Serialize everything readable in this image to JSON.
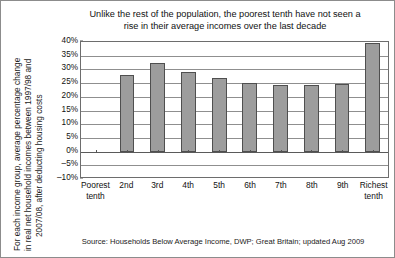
{
  "chart_data": {
    "type": "bar",
    "title": "Unlike the rest of the population, the poorest tenth have not seen a rise in their average incomes over the last decade",
    "title_line1": "Unlike the rest of the population, the poorest tenth have not seen a",
    "title_line2": "rise in their average incomes over the last decade",
    "xlabel": "",
    "ylabel": "For each income group, average percentage change in real net household incomes between 1997/98 and 2007/08, after deducting housing costs",
    "ylabel_line1": "For each income group, average percentage change",
    "ylabel_line2": "in real net household incomes between 1997/98 and",
    "ylabel_line3": "2007/08, after deducting housing costs",
    "categories": [
      "Poorest tenth",
      "2nd",
      "3rd",
      "4th",
      "5th",
      "6th",
      "7th",
      "8th",
      "9th",
      "Richest tenth"
    ],
    "category_lines": [
      [
        "Poorest",
        "tenth"
      ],
      [
        "2nd",
        ""
      ],
      [
        "3rd",
        ""
      ],
      [
        "4th",
        ""
      ],
      [
        "5th",
        ""
      ],
      [
        "6th",
        ""
      ],
      [
        "7th",
        ""
      ],
      [
        "8th",
        ""
      ],
      [
        "9th",
        ""
      ],
      [
        "Richest",
        "tenth"
      ]
    ],
    "values": [
      0,
      28.0,
      32.2,
      29.0,
      26.7,
      25.2,
      24.2,
      24.2,
      24.7,
      39.5
    ],
    "ylim": [
      -10,
      40
    ],
    "ytick_values": [
      40,
      35,
      30,
      25,
      20,
      15,
      10,
      5,
      0,
      -5,
      -10
    ],
    "ytick_labels": [
      "40%",
      "35%",
      "30%",
      "25%",
      "20%",
      "15%",
      "10%",
      "5%",
      "0%",
      "–5%",
      "–10%"
    ],
    "grid": true,
    "legend": null,
    "bar_color": "#9d9d9d",
    "bar_edge_color": "#4f4f4f",
    "source": "Source: Households Below Average Income, DWP; Great Britain; updated Aug 2009"
  }
}
